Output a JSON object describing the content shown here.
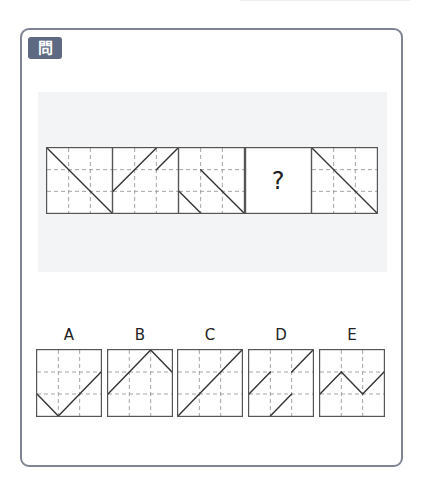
{
  "question": {
    "badge_label": "問14"
  },
  "sequence": {
    "boxes": [
      {
        "index": 1,
        "segments": [
          [
            0,
            0,
            3,
            3
          ]
        ]
      },
      {
        "index": 2,
        "segments": [
          [
            0,
            2,
            2,
            0
          ],
          [
            2,
            1,
            3,
            0
          ]
        ]
      },
      {
        "index": 3,
        "segments": [
          [
            1,
            1,
            3,
            3
          ],
          [
            0,
            2,
            1,
            3
          ]
        ]
      },
      {
        "index": 4,
        "unknown": true,
        "label": "?"
      },
      {
        "index": 5,
        "segments": [
          [
            0,
            0,
            3,
            3
          ]
        ]
      }
    ]
  },
  "options": [
    {
      "label": "A",
      "segments": [
        [
          0,
          2,
          1,
          3
        ],
        [
          1,
          3,
          3,
          1
        ]
      ]
    },
    {
      "label": "B",
      "segments": [
        [
          0,
          2,
          2,
          0
        ],
        [
          2,
          0,
          3,
          1
        ]
      ]
    },
    {
      "label": "C",
      "segments": [
        [
          0,
          3,
          3,
          0
        ]
      ]
    },
    {
      "label": "D",
      "segments": [
        [
          0,
          2,
          1,
          1
        ],
        [
          2,
          1,
          3,
          0
        ],
        [
          1,
          3,
          2,
          2
        ]
      ]
    },
    {
      "label": "E",
      "segments": [
        [
          0,
          2,
          1,
          1
        ],
        [
          1,
          1,
          2,
          2
        ],
        [
          2,
          2,
          3,
          1
        ]
      ]
    }
  ],
  "colors": {
    "card_border": "#7f8594",
    "badge_bg": "#5e6a82",
    "band_bg": "#f3f4f5",
    "box_border": "#555555",
    "grid_dash": "#9a9a9a",
    "line": "#333333"
  }
}
